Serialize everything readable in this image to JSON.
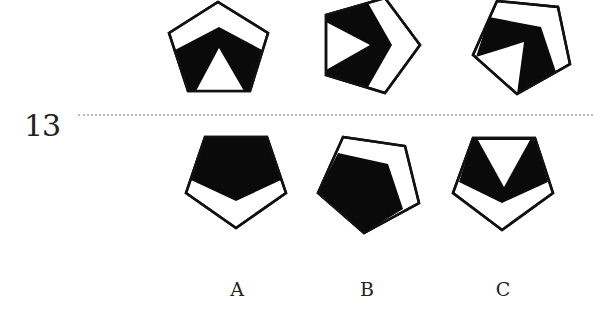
{
  "question": {
    "number": "13"
  },
  "colors": {
    "fill_dark": "#0a0a0a",
    "fill_light": "#ffffff",
    "stroke": "#111111",
    "divider": "#b9b9b9"
  },
  "sequence": {
    "figures": [
      {
        "id": "seq-1",
        "description": "upright pentagon, black band with white triangle, white top chevron"
      },
      {
        "id": "seq-2",
        "description": "pentagon rotated right, black chevron with white triangle"
      },
      {
        "id": "seq-3",
        "description": "pentagon rotated, black band with white triangle"
      }
    ]
  },
  "options": [
    {
      "label": "A",
      "description": "inverted pentagon, black top, white bottom chevron"
    },
    {
      "label": "B",
      "description": "rotated pentagon, black lower-left, white upper-right band"
    },
    {
      "label": "C",
      "description": "inverted pentagon, black band with white top triangle"
    }
  ]
}
